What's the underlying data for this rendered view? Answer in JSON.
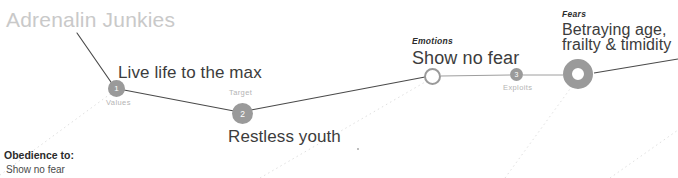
{
  "diagram": {
    "title": "Adrenalin Junkies",
    "title_color": "#c9c9c9",
    "background_color": "#ffffff",
    "line_color": "#4a4a4a",
    "dotted_line_color": "#dedede",
    "node_fill_color": "#9a9a9a",
    "node_text_color": "#ffffff"
  },
  "nodes": [
    {
      "id": "values",
      "number": "1",
      "stage_label": "Values",
      "headline": "Live life to the max",
      "caption": ""
    },
    {
      "id": "target",
      "number": "2",
      "stage_label": "Target",
      "headline": "Restless youth",
      "caption": ""
    },
    {
      "id": "emotions",
      "number": "",
      "stage_label": "",
      "headline": "Show no fear",
      "caption": "Emotions"
    },
    {
      "id": "exploits",
      "number": "3",
      "stage_label": "Exploits",
      "headline": "",
      "caption": ""
    },
    {
      "id": "fears",
      "number": "",
      "stage_label": "",
      "headline_line1": "Betraying age,",
      "headline_line2": "frailty & timidity",
      "caption": "Fears"
    }
  ],
  "footnote": {
    "title": "Obedience to:",
    "body": "Show no fear"
  }
}
